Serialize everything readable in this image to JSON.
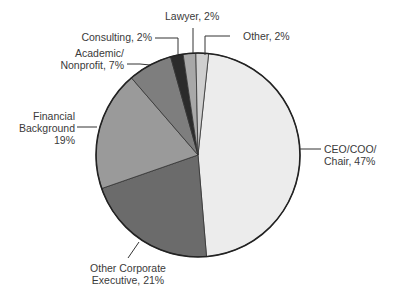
{
  "chart_data": {
    "type": "pie",
    "title": "",
    "start_angle_deg": -90,
    "direction": "clockwise",
    "slices": [
      {
        "label": "CEO/COO/ Chair",
        "value": 47,
        "color": "#ececec"
      },
      {
        "label": "Other Corporate Executive",
        "value": 21,
        "color": "#6b6b6b"
      },
      {
        "label": "Financial Background",
        "value": 19,
        "color": "#9a9a9a"
      },
      {
        "label": "Academic/ Nonprofit",
        "value": 7,
        "color": "#7e7e7e"
      },
      {
        "label": "Consulting",
        "value": 2,
        "color": "#2b2b2b"
      },
      {
        "label": "Lawyer",
        "value": 2,
        "color": "#a8a8a8"
      },
      {
        "label": "Other",
        "value": 2,
        "color": "#cfcfcf"
      }
    ]
  },
  "labels": {
    "ceo_line1": "CEO/COO/",
    "ceo_line2": "Chair, 47%",
    "other_corp_line1": "Other Corporate",
    "other_corp_line2": "Executive, 21%",
    "financial_line1": "Financial",
    "financial_line2": "Background",
    "financial_line3": "19%",
    "academic_line1": "Academic/",
    "academic_line2": "Nonprofit, 7%",
    "consulting": "Consulting, 2%",
    "lawyer": "Lawyer, 2%",
    "other": "Other, 2%"
  }
}
